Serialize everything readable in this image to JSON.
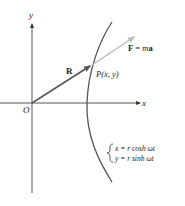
{
  "axes": {
    "x_label": "x",
    "y_label": "y",
    "origin_label": "O"
  },
  "vectors": {
    "position": {
      "label": "R",
      "color": "#555555"
    },
    "force": {
      "label_F": "F",
      "label_eq": " = ",
      "label_m": "m",
      "label_a": "a",
      "color": "#bbbbbb"
    }
  },
  "point": {
    "label": "P(x, y)"
  },
  "curve": {
    "color": "#555555"
  },
  "equations": {
    "line1": "x = r cosh ωt",
    "line2": "y = r sinh ωt"
  }
}
